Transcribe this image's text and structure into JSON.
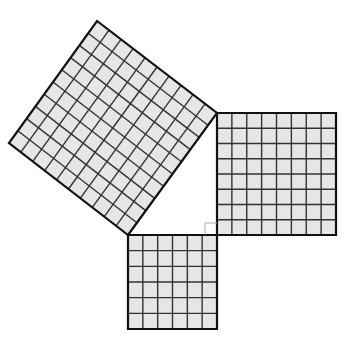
{
  "diagram": {
    "title": "Pythagorean theorem squares",
    "colors": {
      "background": "#ffffff",
      "fill": "#e6e6e6",
      "grid_line": "#333333",
      "outline": "#111111",
      "right_angle_marker": "#aaaaaa"
    },
    "squares": [
      {
        "name": "leg-square-a",
        "units": 6,
        "corners": [
          [
            128,
            235
          ],
          [
            217,
            235
          ],
          [
            217,
            329
          ],
          [
            128,
            329
          ]
        ]
      },
      {
        "name": "leg-square-b",
        "units": 8,
        "corners": [
          [
            217,
            113
          ],
          [
            336,
            113
          ],
          [
            336,
            235
          ],
          [
            217,
            235
          ]
        ]
      },
      {
        "name": "hypotenuse-square-c",
        "units": 10,
        "corners": [
          [
            128,
            235
          ],
          [
            217,
            113
          ],
          [
            97,
            21
          ],
          [
            9,
            143
          ]
        ]
      }
    ],
    "right_angle_marker": {
      "corner": [
        217,
        235
      ],
      "size": 12
    }
  }
}
